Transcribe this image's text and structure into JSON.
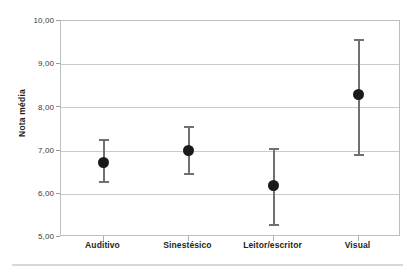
{
  "chart_data": {
    "type": "scatter",
    "title": "",
    "subtitle": "",
    "xlabel": "",
    "ylabel": "Nota média",
    "categories": [
      "Auditivo",
      "Sinestésico",
      "Leitor/escritor",
      "Visual"
    ],
    "series": [
      {
        "name": "Nota média",
        "values": [
          6.73,
          7.0,
          6.2,
          8.3
        ],
        "error_low": [
          6.26,
          6.43,
          5.26,
          6.88
        ],
        "error_high": [
          7.28,
          7.56,
          7.07,
          9.58
        ]
      }
    ],
    "ylim": [
      5.0,
      10.0
    ],
    "ytick_values": [
      10.0,
      9.0,
      8.0,
      7.0,
      6.0,
      5.0
    ],
    "ytick_labels": [
      "10,00",
      "9,00",
      "8,00",
      "7,00",
      "6,00",
      "5,00"
    ],
    "grid": "horizontal",
    "legend": "none",
    "marker": "filled-circle",
    "errorbar_style": "capped-vertical",
    "colors": {
      "marker": "#1a1a1a",
      "errorbar": "#6e7073",
      "gridline": "#c9cacc",
      "frame": "#bcbec0",
      "text": "#231f20",
      "tick_text": "#3a3a3c",
      "background": "#ffffff",
      "bottom_rule": "#d6d7d9"
    }
  }
}
